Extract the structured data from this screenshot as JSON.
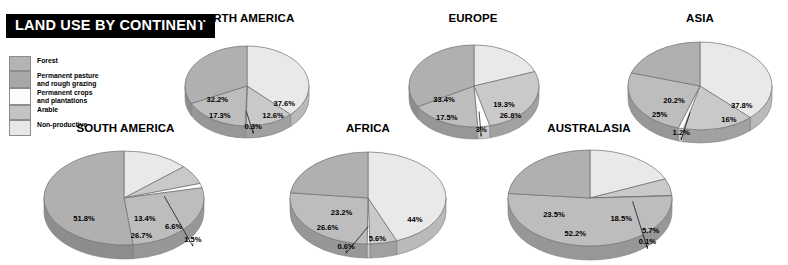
{
  "title": "LAND USE BY CONTINENT",
  "legend": {
    "items": [
      {
        "label": "Forest",
        "color": "#b4b4b4",
        "lines": 1
      },
      {
        "label": "Permanent pasture\nand rough grazing",
        "color": "#a8a8a8",
        "lines": 2
      },
      {
        "label": "Permanent crops\nand plantations",
        "color": "#fbfbfb",
        "lines": 2
      },
      {
        "label": "Arable",
        "color": "#c3c3c3",
        "lines": 1
      },
      {
        "label": "Non-productive",
        "color": "#e8e8e8",
        "lines": 1
      }
    ]
  },
  "chart_data": {
    "type": "pie",
    "title": "LAND USE BY CONTINENT",
    "categories": [
      "Forest",
      "Permanent pasture and rough grazing",
      "Permanent crops and plantations",
      "Arable",
      "Non-productive"
    ],
    "category_colors": [
      "#e9e9e9",
      "#c9c9c9",
      "#fcfcfc",
      "#bdbdbd",
      "#b0b0b0"
    ],
    "unit": "percent",
    "charts": [
      {
        "name": "NORTH AMERICA",
        "values": [
          37.6,
          12.6,
          0.3,
          17.3,
          32.2
        ],
        "labels": [
          "37.6%",
          "12.6%",
          "0.3%",
          "17.3%",
          "32.2%"
        ]
      },
      {
        "name": "EUROPE",
        "values": [
          19.3,
          26.8,
          3.0,
          17.5,
          33.4
        ],
        "labels": [
          "19.3%",
          "26.8%",
          "3%",
          "17.5%",
          "33.4%"
        ]
      },
      {
        "name": "ASIA",
        "values": [
          37.8,
          16.0,
          1.2,
          25.0,
          20.2
        ],
        "labels": [
          "37.8%",
          "16%",
          "1.2%",
          "25%",
          "20.2%"
        ]
      },
      {
        "name": "SOUTH AMERICA",
        "values": [
          13.4,
          6.6,
          1.5,
          26.7,
          51.8
        ],
        "labels": [
          "13.4%",
          "6.6%",
          "1.5%",
          "26.7%",
          "51.8%"
        ]
      },
      {
        "name": "AFRICA",
        "values": [
          44.0,
          5.6,
          0.6,
          26.6,
          23.2
        ],
        "labels": [
          "44%",
          "5.6%",
          "0.6%",
          "26.6%",
          "23.2%"
        ]
      },
      {
        "name": "AUSTRALASIA",
        "values": [
          18.5,
          5.7,
          0.1,
          52.2,
          23.5
        ],
        "labels": [
          "18.5%",
          "5.7%",
          "0.1%",
          "52.2%",
          "23.5%"
        ]
      }
    ]
  },
  "layout": {
    "charts": [
      {
        "key": "north-america",
        "left": 175,
        "top": 12,
        "width": 140,
        "cx": 72,
        "cy": 60,
        "rx": 62,
        "ry": 40,
        "depth": 12
      },
      {
        "key": "europe",
        "left": 398,
        "top": 12,
        "width": 150,
        "cx": 76,
        "cy": 60,
        "rx": 65,
        "ry": 41,
        "depth": 12
      },
      {
        "key": "asia",
        "left": 620,
        "top": 12,
        "width": 160,
        "cx": 80,
        "cy": 60,
        "rx": 72,
        "ry": 44,
        "depth": 13
      },
      {
        "key": "south-america",
        "left": 38,
        "top": 122,
        "width": 175,
        "cx": 86,
        "cy": 62,
        "rx": 80,
        "ry": 47,
        "depth": 14
      },
      {
        "key": "africa",
        "left": 282,
        "top": 122,
        "width": 172,
        "cx": 86,
        "cy": 62,
        "rx": 78,
        "ry": 46,
        "depth": 14
      },
      {
        "key": "australasia",
        "left": 500,
        "top": 122,
        "width": 178,
        "cx": 90,
        "cy": 62,
        "rx": 82,
        "ry": 48,
        "depth": 14
      }
    ],
    "label_positions": [
      [
        [
          0.6,
          0.5
        ],
        [
          0.42,
          0.8
        ],
        [
          0.1,
          1.07
        ],
        [
          -0.44,
          0.8
        ],
        [
          -0.48,
          0.4
        ]
      ],
      [
        [
          0.46,
          0.52
        ],
        [
          0.56,
          0.78
        ],
        [
          0.11,
          1.12
        ],
        [
          -0.42,
          0.84
        ],
        [
          -0.46,
          0.38
        ]
      ],
      [
        [
          0.58,
          0.5
        ],
        [
          0.4,
          0.82
        ],
        [
          -0.26,
          1.12
        ],
        [
          -0.56,
          0.7
        ],
        [
          -0.36,
          0.38
        ]
      ],
      [
        [
          0.26,
          0.48
        ],
        [
          0.62,
          0.66
        ],
        [
          0.86,
          0.93
        ],
        [
          0.22,
          0.86
        ],
        [
          -0.5,
          0.48
        ]
      ],
      [
        [
          0.6,
          0.52
        ],
        [
          0.12,
          0.94
        ],
        [
          -0.28,
          1.1
        ],
        [
          -0.52,
          0.7
        ],
        [
          -0.34,
          0.38
        ]
      ],
      [
        [
          0.38,
          0.48
        ],
        [
          0.74,
          0.72
        ],
        [
          0.7,
          0.96
        ],
        [
          -0.18,
          0.8
        ],
        [
          -0.44,
          0.4
        ]
      ]
    ],
    "leaders": [
      [
        2
      ],
      [
        2
      ],
      [
        2
      ],
      [
        2
      ],
      [
        2
      ],
      [
        2
      ]
    ]
  }
}
